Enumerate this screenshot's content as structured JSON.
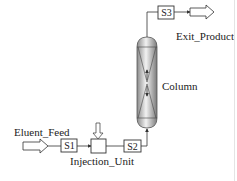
{
  "diagram": {
    "type": "process-flow",
    "colors": {
      "line": "#333333",
      "background": "#ffffff",
      "column_fill": "#bdbdbd"
    },
    "nodes": [
      {
        "id": "eluent_feed",
        "label": "Eluent_Feed",
        "kind": "feed-arrow"
      },
      {
        "id": "s1",
        "label": "S1",
        "kind": "stream"
      },
      {
        "id": "injection_unit",
        "label": "Injection_Unit",
        "kind": "unit"
      },
      {
        "id": "s2",
        "label": "S2",
        "kind": "stream"
      },
      {
        "id": "column",
        "label": "Column",
        "kind": "column"
      },
      {
        "id": "s3",
        "label": "S3",
        "kind": "stream"
      },
      {
        "id": "exit_product",
        "label": "Exit_Product",
        "kind": "product-arrow"
      }
    ],
    "edges": [
      {
        "from": "eluent_feed",
        "to": "s1"
      },
      {
        "from": "s1",
        "to": "injection_unit"
      },
      {
        "from": "injection_unit",
        "to": "s2"
      },
      {
        "from": "s2",
        "to": "column"
      },
      {
        "from": "column",
        "to": "s3"
      },
      {
        "from": "s3",
        "to": "exit_product"
      }
    ]
  }
}
